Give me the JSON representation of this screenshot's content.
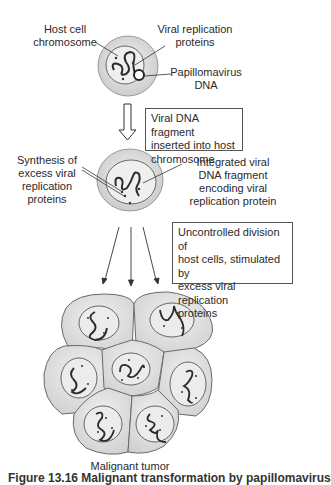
{
  "diagram": {
    "step1": {
      "labels": {
        "host_chromosome": [
          "Host cell",
          "chromosome"
        ],
        "viral_proteins": [
          "Viral replication",
          "proteins"
        ],
        "papilloma_dna": [
          "Papillomavirus",
          "DNA"
        ]
      }
    },
    "arrow1_box": {
      "lines": [
        "Viral DNA fragment",
        "inserted into host",
        "chromosome"
      ]
    },
    "step2": {
      "labels": {
        "synthesis": [
          "Synthesis of",
          "excess viral",
          "replication",
          "proteins"
        ],
        "integrated": [
          "Integrated viral",
          "DNA fragment",
          "encoding viral",
          "replication protein"
        ]
      }
    },
    "arrow2_box": {
      "lines": [
        "Uncontrolled division of",
        "host cells, stimulated by",
        "excess viral replication",
        "proteins"
      ]
    },
    "tumor_label": "Malignant tumor",
    "caption_partial": "Figure 13.16  Malignant transformation by papillomavirus",
    "colors": {
      "cell_outer": "#d9d9d9",
      "cell_inner": "#eeeeee",
      "outline": "#555555",
      "chromosome": "#2b2b2b"
    }
  }
}
